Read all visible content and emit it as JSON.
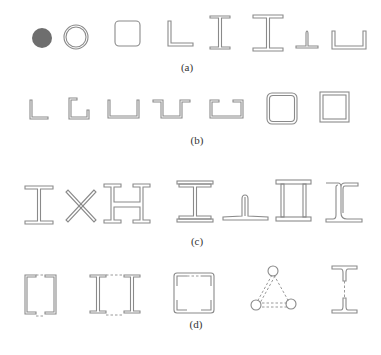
{
  "figure": {
    "rows": [
      {
        "caption": "(a)",
        "description": "Solid-web (rolled) section shapes",
        "shapes": [
          "solid-round-bar",
          "circular-tube",
          "square-tube",
          "equal-angle",
          "i-beam",
          "wide-flange-h-beam",
          "t-section",
          "channel"
        ]
      },
      {
        "caption": "(b)",
        "description": "Cold-formed thin-walled section shapes",
        "shapes": [
          "cold-formed-angle",
          "lipped-angle",
          "cold-formed-channel",
          "hat-section",
          "lipped-channel",
          "rounded-square-tube",
          "square-box"
        ]
      },
      {
        "caption": "(c)",
        "description": "Built-up solid-web section shapes",
        "shapes": [
          "welded-i-section",
          "cross-section",
          "built-up-h-section",
          "i-with-cover-plates",
          "t-with-angles",
          "box-section-with-plates",
          "rail-like-section"
        ]
      },
      {
        "caption": "(d)",
        "description": "Lattice (laced) built-up section shapes",
        "shapes": [
          "laced-channels",
          "laced-i-beams",
          "laced-four-angles",
          "laced-three-tubes",
          "laced-two-t-sections"
        ]
      }
    ]
  }
}
